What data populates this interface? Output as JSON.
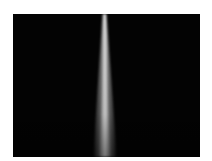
{
  "image": {
    "description": "Spray jet visualization on black background",
    "background_color": "#030303",
    "jet_color": "#e6e6e6",
    "jet_top_x": 91,
    "jet_bottom_x": 92,
    "jet_top_width": 3,
    "jet_bottom_width": 22
  }
}
